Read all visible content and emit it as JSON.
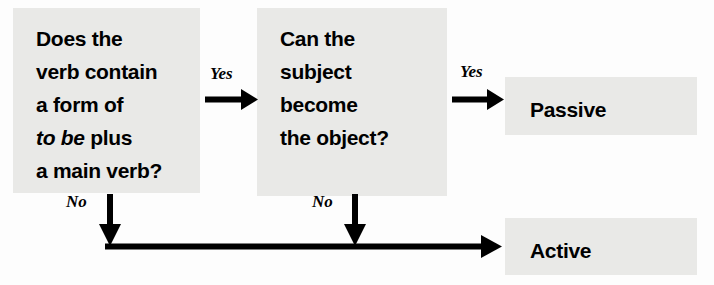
{
  "diagram": {
    "background_color": "#fdfdfd",
    "box_fill_color": "#e9e9e7",
    "line_color": "#000000",
    "nodes": {
      "question_1": {
        "line_1": "Does the",
        "line_2": "verb contain",
        "line_3": "a form of",
        "line_4_italic": "to be",
        "line_4_rest": " plus",
        "line_5": "a main verb?"
      },
      "question_2": {
        "line_1": "Can the",
        "line_2": "subject",
        "line_3": "become",
        "line_4": "the object?"
      },
      "outcome_passive": "Passive",
      "outcome_active": "Active"
    },
    "edges": {
      "yes_1": "Yes",
      "yes_2": "Yes",
      "no_1": "No",
      "no_2": "No"
    }
  }
}
